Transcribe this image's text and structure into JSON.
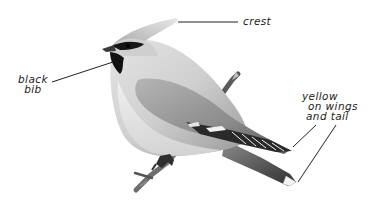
{
  "figure": {
    "style": "grayscale pencil illustration",
    "colors": {
      "background": "#ffffff",
      "ink": "#222222",
      "body_light": "#d9d9d9",
      "body_mid": "#a8a8a8",
      "wing_dark": "#5a5a5a",
      "mask_black": "#111111"
    }
  },
  "labels": {
    "crest": {
      "text": "crest"
    },
    "black_bib": {
      "lines": [
        "black",
        "bib"
      ]
    },
    "yellow_wings_tail": {
      "lines": [
        "yellow",
        "on wings",
        "and tail"
      ]
    }
  }
}
